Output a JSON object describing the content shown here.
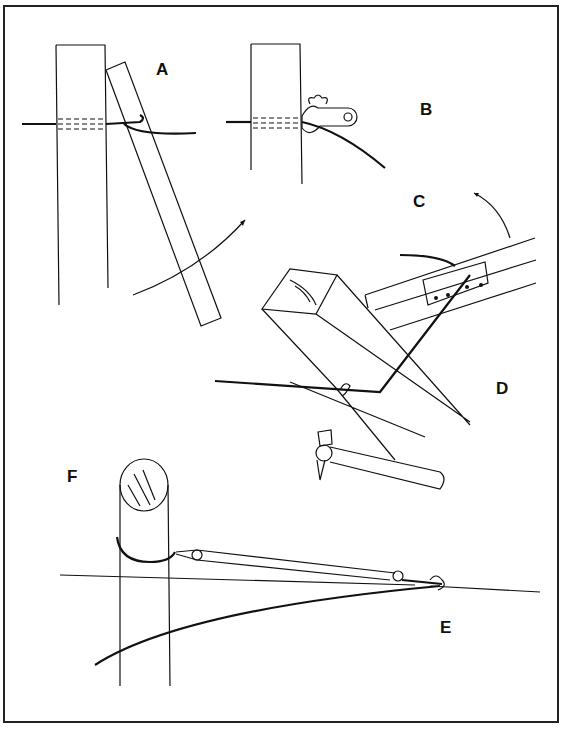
{
  "figure": {
    "panels": [
      {
        "id": "A",
        "label": "A",
        "caption": "Wire through post, bent around a lever bar"
      },
      {
        "id": "B",
        "label": "B",
        "caption": "Wire secured with a wing-nut wire strainer at post"
      },
      {
        "id": "C",
        "label": "C",
        "caption": "Lever swung in direction of arrow"
      },
      {
        "id": "D",
        "label": "D",
        "caption": "Wire stapled to square post; hammer shown"
      },
      {
        "id": "E",
        "label": "E",
        "caption": "Wire joined with turnbuckle/strainer"
      },
      {
        "id": "F",
        "label": "F",
        "caption": "Block and tackle attached around round post"
      }
    ]
  }
}
